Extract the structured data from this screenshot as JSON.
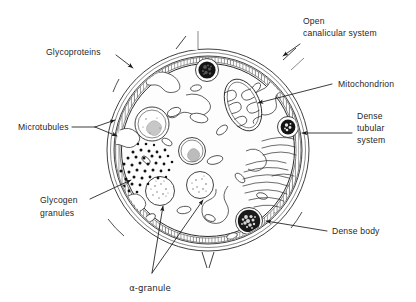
{
  "figure": {
    "background_color": "#ffffff",
    "line_color": "#1a1a1a",
    "width": 416,
    "height": 302
  },
  "labels": [
    {
      "id": "glycoproteins",
      "text": "Glycoproteins",
      "lines": [
        "Glycoproteins"
      ],
      "x": 46,
      "y": 52,
      "anchor": "start",
      "arrow_from": [
        116,
        55
      ],
      "arrow_to": [
        133,
        68
      ]
    },
    {
      "id": "open-canalicular-system",
      "text": "Open canalicular system",
      "lines": [
        "Open",
        "canalicular system"
      ],
      "x": 303,
      "y": 24,
      "anchor": "start",
      "arrow_from": [
        300,
        43
      ],
      "arrow_to": [
        282,
        55
      ]
    },
    {
      "id": "mitochondrion",
      "text": "Mitochondrion",
      "lines": [
        "Mitochondrion"
      ],
      "x": 336,
      "y": 87,
      "anchor": "start",
      "arrow_from": [
        333,
        84
      ],
      "arrow_to": [
        256,
        103
      ]
    },
    {
      "id": "dense-tubular-system",
      "text": "Dense tubular system",
      "lines": [
        "Dense",
        "tubular",
        "system"
      ],
      "x": 355,
      "y": 117,
      "anchor": "start",
      "arrow_from": [
        352,
        133
      ],
      "arrow_to": [
        300,
        133
      ]
    },
    {
      "id": "dense-body",
      "text": "Dense body",
      "lines": [
        "Dense body"
      ],
      "x": 330,
      "y": 234,
      "anchor": "start",
      "arrow_from": [
        327,
        231
      ],
      "arrow_to": [
        264,
        221
      ]
    },
    {
      "id": "microtubules",
      "text": "Microtubules",
      "lines": [
        "Microtubules"
      ],
      "x": 18,
      "y": 130,
      "anchor": "start",
      "arrow_from": [
        78,
        127
      ],
      "arrow_to": [
        113,
        124
      ]
    },
    {
      "id": "glycogen-granules",
      "text": "Glycogen granules",
      "lines": [
        "Glycogen",
        "granules"
      ],
      "x": 40,
      "y": 203,
      "anchor": "start",
      "arrow_from": [
        92,
        199
      ],
      "arrow_to": [
        132,
        179
      ]
    },
    {
      "id": "alpha-granule",
      "text": "α-granule",
      "lines": [
        "α-granule"
      ],
      "x": 150,
      "y": 290,
      "anchor": "middle",
      "arrow_from": [
        152,
        273
      ],
      "arrow_to": [
        160,
        192
      ]
    }
  ],
  "structures": {
    "cell_membrane": "multi-layered plasma membrane with glycoprotein coat",
    "microtubule_band": "circumferential hatched marginal band",
    "canalicular_openings": [
      "top gap",
      "bottom notch",
      "upper-right invagination"
    ],
    "organelles": [
      {
        "name": "mitochondrion",
        "cx": 243,
        "cy": 105,
        "rx": 18,
        "ry": 27,
        "rotation": -22
      },
      {
        "name": "dense-granule-top",
        "cx": 207,
        "cy": 70,
        "r": 11
      },
      {
        "name": "dense-granule-right",
        "cx": 288,
        "cy": 127,
        "r": 10
      },
      {
        "name": "dense-body",
        "cx": 249,
        "cy": 221,
        "r": 13
      },
      {
        "name": "alpha-granule-left",
        "cx": 160,
        "cy": 191,
        "r": 14
      },
      {
        "name": "alpha-granule-right",
        "cx": 200,
        "cy": 185,
        "r": 13
      },
      {
        "name": "granule-upper-left",
        "cx": 152,
        "cy": 124,
        "r": 17
      },
      {
        "name": "granule-mid",
        "cx": 192,
        "cy": 151,
        "r": 13
      }
    ],
    "glycogen_cluster": {
      "cx": 143,
      "cy": 170,
      "count": 62
    }
  }
}
